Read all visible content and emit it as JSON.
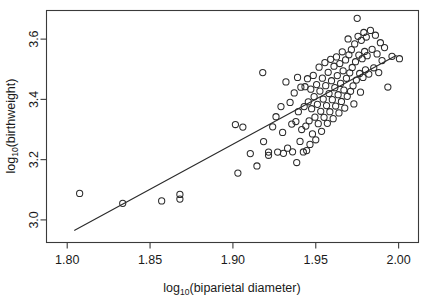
{
  "chart_data": {
    "type": "scatter",
    "title": "",
    "xlabel": "log10(biparietal diameter)",
    "xlabel_base": "log",
    "xlabel_sub": "10",
    "xlabel_rest": "(biparietal diameter)",
    "ylabel": "log10(birthweight)",
    "ylabel_base": "log",
    "ylabel_sub": "10",
    "ylabel_rest": "(birthweight)",
    "xlim": [
      1.7875,
      2.012
    ],
    "ylim": [
      2.925,
      3.695
    ],
    "xticks": [
      1.8,
      1.85,
      1.9,
      1.95,
      2.0
    ],
    "xtick_labels": [
      "1.80",
      "1.85",
      "1.90",
      "1.95",
      "2.00"
    ],
    "yticks": [
      3.0,
      3.2,
      3.4,
      3.6
    ],
    "ytick_labels": [
      "3.0",
      "3.2",
      "3.4",
      "3.6"
    ],
    "grid": false,
    "legend": null,
    "marker": "open-circle",
    "marker_color": "#2b2b2b",
    "line_color": "#2b2b2b",
    "fit_line": {
      "type": "linear-regression",
      "x_start": 1.8045,
      "y_start": 2.9655,
      "x_end": 1.9985,
      "y_end": 3.5455
    },
    "x": [
      1.8075,
      1.8335,
      1.857,
      1.868,
      1.868,
      1.9015,
      1.903,
      1.906,
      1.9105,
      1.9145,
      1.918,
      1.9185,
      1.9215,
      1.9215,
      1.924,
      1.926,
      1.927,
      1.929,
      1.93,
      1.9305,
      1.932,
      1.933,
      1.9345,
      1.9355,
      1.936,
      1.937,
      1.938,
      1.9385,
      1.939,
      1.9395,
      1.9405,
      1.941,
      1.9415,
      1.9425,
      1.943,
      1.9435,
      1.944,
      1.9445,
      1.945,
      1.9455,
      1.946,
      1.9465,
      1.947,
      1.9475,
      1.948,
      1.9485,
      1.949,
      1.9495,
      1.95,
      1.9505,
      1.951,
      1.9515,
      1.952,
      1.9525,
      1.953,
      1.9535,
      1.954,
      1.9545,
      1.955,
      1.9555,
      1.956,
      1.9565,
      1.957,
      1.9575,
      1.958,
      1.9585,
      1.959,
      1.9595,
      1.96,
      1.9605,
      1.961,
      1.9615,
      1.962,
      1.9625,
      1.963,
      1.9635,
      1.964,
      1.9645,
      1.965,
      1.9655,
      1.966,
      1.9665,
      1.967,
      1.9675,
      1.968,
      1.9685,
      1.969,
      1.9695,
      1.97,
      1.9705,
      1.971,
      1.9715,
      1.972,
      1.9725,
      1.973,
      1.9735,
      1.974,
      1.9745,
      1.975,
      1.9755,
      1.976,
      1.9765,
      1.977,
      1.9775,
      1.978,
      1.9785,
      1.979,
      1.9795,
      1.98,
      1.9805,
      1.981,
      1.982,
      1.983,
      1.984,
      1.985,
      1.986,
      1.987,
      1.988,
      1.989,
      1.99,
      1.9915,
      1.9935,
      1.996,
      2.0005
    ],
    "y": [
      3.088,
      3.055,
      3.063,
      3.069,
      3.0845,
      3.3165,
      3.1555,
      3.308,
      3.22,
      3.179,
      3.489,
      3.26,
      3.225,
      3.2145,
      3.309,
      3.3425,
      3.225,
      3.376,
      3.2905,
      3.221,
      3.458,
      3.238,
      3.39,
      3.318,
      3.226,
      3.4215,
      3.3265,
      3.1905,
      3.473,
      3.359,
      3.2605,
      3.4405,
      3.3,
      3.2255,
      3.376,
      3.442,
      3.3115,
      3.23,
      3.4685,
      3.392,
      3.329,
      3.2505,
      3.434,
      3.369,
      3.2855,
      3.4795,
      3.409,
      3.341,
      3.266,
      3.449,
      3.3835,
      3.3195,
      3.507,
      3.4275,
      3.3605,
      3.294,
      3.4705,
      3.401,
      3.3405,
      3.522,
      3.4455,
      3.3795,
      3.3205,
      3.49,
      3.4195,
      3.359,
      3.533,
      3.462,
      3.399,
      3.336,
      3.51,
      3.439,
      3.378,
      3.541,
      3.479,
      3.4155,
      3.355,
      3.519,
      3.453,
      3.393,
      3.558,
      3.495,
      3.431,
      3.371,
      3.531,
      3.47,
      3.41,
      3.6005,
      3.548,
      3.488,
      3.427,
      3.565,
      3.506,
      3.445,
      3.385,
      3.584,
      3.525,
      3.464,
      3.669,
      3.6095,
      3.547,
      3.486,
      3.424,
      3.596,
      3.535,
      3.473,
      3.622,
      3.559,
      3.498,
      3.607,
      3.545,
      3.484,
      3.629,
      3.566,
      3.505,
      3.613,
      3.551,
      3.489,
      3.588,
      3.529,
      3.572,
      3.441,
      3.543,
      3.535
    ]
  }
}
